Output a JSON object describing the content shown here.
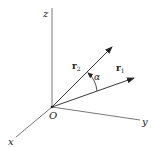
{
  "diagram": {
    "type": "3d-coordinate-vectors",
    "origin": {
      "label": "O",
      "px": [
        52,
        107
      ]
    },
    "axes": [
      {
        "name": "z",
        "label": "z",
        "end": [
          52,
          8
        ],
        "label_pos": [
          43,
          17
        ]
      },
      {
        "name": "y",
        "label": "y",
        "end": [
          140,
          120
        ],
        "label_pos": [
          142,
          124
        ]
      },
      {
        "name": "x",
        "label": "x",
        "end": [
          16,
          137
        ],
        "label_pos": [
          8,
          145
        ]
      }
    ],
    "vectors": [
      {
        "name": "r2",
        "label": "r",
        "subscript": "2",
        "tip": [
          112,
          47
        ],
        "label_pos": [
          72,
          69
        ]
      },
      {
        "name": "r1",
        "label": "r",
        "subscript": "1",
        "tip": [
          134,
          78
        ],
        "label_pos": [
          116,
          71
        ]
      }
    ],
    "angle": {
      "label": "α",
      "between": [
        "r1",
        "r2"
      ],
      "label_pos": [
        94,
        80
      ]
    },
    "colors": {
      "ink": "#222222",
      "axis": "#555555",
      "background": "#ffffff"
    }
  }
}
